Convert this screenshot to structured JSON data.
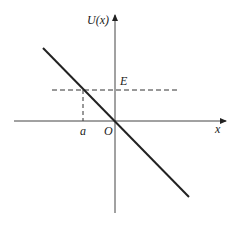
{
  "diagram": {
    "axes": {
      "y_label": "U(x)",
      "x_label": "x",
      "origin_label": "O"
    },
    "annotations": {
      "energy_label": "E",
      "turning_point_label": "a"
    },
    "elements": [
      {
        "type": "line",
        "description": "U(x) decreasing linear function through origin"
      },
      {
        "type": "dashed-line",
        "description": "horizontal energy level E"
      },
      {
        "type": "dashed-line",
        "description": "vertical from intersection down to x = a"
      }
    ],
    "colors": {
      "line": "#222222",
      "background": "#ffffff"
    }
  }
}
